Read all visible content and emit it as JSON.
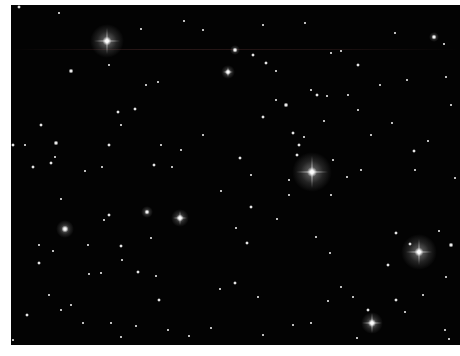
{
  "image": {
    "subject": "star field",
    "background_color": "#030303",
    "border_color": "#ffffff"
  },
  "bright_stars": [
    {
      "x": 96,
      "y": 36,
      "size": 9,
      "halo": 34,
      "spikes": 26
    },
    {
      "x": 301,
      "y": 167,
      "size": 10,
      "halo": 40,
      "spikes": 32
    },
    {
      "x": 408,
      "y": 247,
      "size": 9,
      "halo": 36,
      "spikes": 26
    },
    {
      "x": 361,
      "y": 318,
      "size": 8,
      "halo": 22,
      "spikes": 20
    },
    {
      "x": 169,
      "y": 213,
      "size": 7,
      "halo": 18,
      "spikes": 14
    },
    {
      "x": 54,
      "y": 224,
      "size": 7,
      "halo": 18,
      "spikes": 0
    },
    {
      "x": 217,
      "y": 67,
      "size": 6,
      "halo": 14,
      "spikes": 10
    },
    {
      "x": 224,
      "y": 45,
      "size": 5,
      "halo": 10,
      "spikes": 0
    },
    {
      "x": 423,
      "y": 32,
      "size": 5,
      "halo": 10,
      "spikes": 0
    },
    {
      "x": 136,
      "y": 207,
      "size": 5,
      "halo": 12,
      "spikes": 0
    }
  ],
  "stars": [
    {
      "x": 8,
      "y": 2,
      "s": 3
    },
    {
      "x": 48,
      "y": 8,
      "s": 2
    },
    {
      "x": 60,
      "y": 66,
      "s": 4
    },
    {
      "x": 30,
      "y": 120,
      "s": 3
    },
    {
      "x": 45,
      "y": 138,
      "s": 4
    },
    {
      "x": 98,
      "y": 60,
      "s": 2
    },
    {
      "x": 107,
      "y": 107,
      "s": 3
    },
    {
      "x": 130,
      "y": 24,
      "s": 2
    },
    {
      "x": 147,
      "y": 77,
      "s": 2
    },
    {
      "x": 173,
      "y": 16,
      "s": 2
    },
    {
      "x": 192,
      "y": 25,
      "s": 2
    },
    {
      "x": 124,
      "y": 104,
      "s": 3
    },
    {
      "x": 40,
      "y": 158,
      "s": 3
    },
    {
      "x": 22,
      "y": 162,
      "s": 3
    },
    {
      "x": 74,
      "y": 166,
      "s": 2
    },
    {
      "x": 143,
      "y": 160,
      "s": 3
    },
    {
      "x": 161,
      "y": 162,
      "s": 2
    },
    {
      "x": 91,
      "y": 162,
      "s": 2
    },
    {
      "x": 44,
      "y": 152,
      "s": 2
    },
    {
      "x": 2,
      "y": 140,
      "s": 3
    },
    {
      "x": 14,
      "y": 140,
      "s": 2
    },
    {
      "x": 98,
      "y": 140,
      "s": 3
    },
    {
      "x": 110,
      "y": 120,
      "s": 2
    },
    {
      "x": 135,
      "y": 80,
      "s": 2
    },
    {
      "x": 170,
      "y": 145,
      "s": 2
    },
    {
      "x": 192,
      "y": 130,
      "s": 2
    },
    {
      "x": 150,
      "y": 140,
      "s": 2
    },
    {
      "x": 242,
      "y": 50,
      "s": 3
    },
    {
      "x": 252,
      "y": 20,
      "s": 2
    },
    {
      "x": 294,
      "y": 18,
      "s": 2
    },
    {
      "x": 320,
      "y": 48,
      "s": 2
    },
    {
      "x": 330,
      "y": 46,
      "s": 2
    },
    {
      "x": 347,
      "y": 60,
      "s": 3
    },
    {
      "x": 384,
      "y": 28,
      "s": 2
    },
    {
      "x": 433,
      "y": 39,
      "s": 2
    },
    {
      "x": 255,
      "y": 58,
      "s": 3
    },
    {
      "x": 265,
      "y": 66,
      "s": 2
    },
    {
      "x": 275,
      "y": 100,
      "s": 4
    },
    {
      "x": 300,
      "y": 85,
      "s": 2
    },
    {
      "x": 306,
      "y": 90,
      "s": 3
    },
    {
      "x": 316,
      "y": 91,
      "s": 2
    },
    {
      "x": 313,
      "y": 116,
      "s": 2
    },
    {
      "x": 337,
      "y": 90,
      "s": 2
    },
    {
      "x": 347,
      "y": 105,
      "s": 2
    },
    {
      "x": 369,
      "y": 80,
      "s": 2
    },
    {
      "x": 396,
      "y": 75,
      "s": 2
    },
    {
      "x": 435,
      "y": 72,
      "s": 2
    },
    {
      "x": 252,
      "y": 112,
      "s": 3
    },
    {
      "x": 265,
      "y": 95,
      "s": 2
    },
    {
      "x": 282,
      "y": 128,
      "s": 3
    },
    {
      "x": 288,
      "y": 140,
      "s": 3
    },
    {
      "x": 293,
      "y": 132,
      "s": 2
    },
    {
      "x": 322,
      "y": 155,
      "s": 2
    },
    {
      "x": 336,
      "y": 172,
      "s": 2
    },
    {
      "x": 350,
      "y": 165,
      "s": 2
    },
    {
      "x": 403,
      "y": 146,
      "s": 3
    },
    {
      "x": 417,
      "y": 136,
      "s": 2
    },
    {
      "x": 229,
      "y": 153,
      "s": 3
    },
    {
      "x": 240,
      "y": 170,
      "s": 2
    },
    {
      "x": 286,
      "y": 150,
      "s": 3
    },
    {
      "x": 278,
      "y": 175,
      "s": 2
    },
    {
      "x": 210,
      "y": 186,
      "s": 2
    },
    {
      "x": 320,
      "y": 190,
      "s": 2
    },
    {
      "x": 50,
      "y": 194,
      "s": 2
    },
    {
      "x": 98,
      "y": 210,
      "s": 3
    },
    {
      "x": 93,
      "y": 215,
      "s": 2
    },
    {
      "x": 28,
      "y": 240,
      "s": 2
    },
    {
      "x": 42,
      "y": 246,
      "s": 2
    },
    {
      "x": 77,
      "y": 240,
      "s": 2
    },
    {
      "x": 110,
      "y": 241,
      "s": 3
    },
    {
      "x": 140,
      "y": 233,
      "s": 2
    },
    {
      "x": 111,
      "y": 255,
      "s": 2
    },
    {
      "x": 28,
      "y": 258,
      "s": 3
    },
    {
      "x": 78,
      "y": 269,
      "s": 2
    },
    {
      "x": 90,
      "y": 268,
      "s": 2
    },
    {
      "x": 127,
      "y": 267,
      "s": 3
    },
    {
      "x": 145,
      "y": 271,
      "s": 2
    },
    {
      "x": 148,
      "y": 295,
      "s": 3
    },
    {
      "x": 38,
      "y": 290,
      "s": 2
    },
    {
      "x": 60,
      "y": 300,
      "s": 2
    },
    {
      "x": 50,
      "y": 305,
      "s": 2
    },
    {
      "x": 16,
      "y": 310,
      "s": 3
    },
    {
      "x": 72,
      "y": 318,
      "s": 2
    },
    {
      "x": 100,
      "y": 318,
      "s": 2
    },
    {
      "x": 125,
      "y": 321,
      "s": 2
    },
    {
      "x": 157,
      "y": 325,
      "s": 2
    },
    {
      "x": 2,
      "y": 335,
      "s": 2
    },
    {
      "x": 110,
      "y": 332,
      "s": 2
    },
    {
      "x": 178,
      "y": 331,
      "s": 2
    },
    {
      "x": 200,
      "y": 323,
      "s": 2
    },
    {
      "x": 240,
      "y": 202,
      "s": 3
    },
    {
      "x": 266,
      "y": 214,
      "s": 2
    },
    {
      "x": 225,
      "y": 223,
      "s": 2
    },
    {
      "x": 236,
      "y": 238,
      "s": 3
    },
    {
      "x": 305,
      "y": 232,
      "s": 2
    },
    {
      "x": 319,
      "y": 248,
      "s": 2
    },
    {
      "x": 385,
      "y": 228,
      "s": 3
    },
    {
      "x": 428,
      "y": 226,
      "s": 2
    },
    {
      "x": 440,
      "y": 240,
      "s": 4
    },
    {
      "x": 399,
      "y": 239,
      "s": 3
    },
    {
      "x": 377,
      "y": 260,
      "s": 3
    },
    {
      "x": 224,
      "y": 278,
      "s": 3
    },
    {
      "x": 209,
      "y": 284,
      "s": 2
    },
    {
      "x": 247,
      "y": 292,
      "s": 2
    },
    {
      "x": 317,
      "y": 296,
      "s": 2
    },
    {
      "x": 282,
      "y": 320,
      "s": 2
    },
    {
      "x": 300,
      "y": 318,
      "s": 2
    },
    {
      "x": 385,
      "y": 295,
      "s": 3
    },
    {
      "x": 394,
      "y": 307,
      "s": 2
    },
    {
      "x": 357,
      "y": 305,
      "s": 3
    },
    {
      "x": 252,
      "y": 330,
      "s": 2
    },
    {
      "x": 346,
      "y": 333,
      "s": 2
    },
    {
      "x": 438,
      "y": 334,
      "s": 2
    },
    {
      "x": 266,
      "y": 342,
      "s": 2
    },
    {
      "x": 412,
      "y": 290,
      "s": 2
    },
    {
      "x": 435,
      "y": 272,
      "s": 2
    },
    {
      "x": 434,
      "y": 325,
      "s": 2
    },
    {
      "x": 330,
      "y": 282,
      "s": 2
    },
    {
      "x": 342,
      "y": 292,
      "s": 2
    },
    {
      "x": 278,
      "y": 190,
      "s": 2
    },
    {
      "x": 360,
      "y": 130,
      "s": 2
    },
    {
      "x": 381,
      "y": 118,
      "s": 2
    },
    {
      "x": 440,
      "y": 100,
      "s": 2
    },
    {
      "x": 444,
      "y": 173,
      "s": 2
    },
    {
      "x": 404,
      "y": 165,
      "s": 2
    }
  ]
}
